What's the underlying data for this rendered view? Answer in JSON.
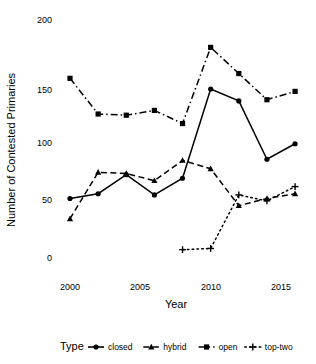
{
  "chart_data": {
    "type": "line",
    "title": "",
    "xlabel": "Year",
    "ylabel": "Number of Contested Primaries",
    "xlim": [
      1999,
      2017
    ],
    "ylim": [
      0,
      200
    ],
    "xticks": [
      2000,
      2005,
      2010,
      2015
    ],
    "xtick_labels": [
      "2000",
      "2005",
      "2010",
      "2015"
    ],
    "yticks": [
      0,
      50,
      100,
      150,
      200
    ],
    "ytick_labels": [
      "0",
      "50",
      "100",
      "150",
      "200"
    ],
    "grid": false,
    "legend_position": "bottom",
    "legend_title": "Type",
    "series": [
      {
        "name": "closed",
        "marker": "circle",
        "dash": "solid",
        "x": [
          2000,
          2002,
          2004,
          2006,
          2008,
          2010,
          2012,
          2014,
          2016
        ],
        "values": [
          50,
          54,
          70,
          53,
          67,
          142,
          132,
          83,
          96
        ]
      },
      {
        "name": "hybrid",
        "marker": "triangle",
        "dash": "dashed",
        "x": [
          2000,
          2002,
          2004,
          2006,
          2008,
          2010,
          2012,
          2014,
          2016
        ],
        "values": [
          33,
          72,
          71,
          65,
          82,
          75,
          44,
          50,
          54
        ]
      },
      {
        "name": "open",
        "marker": "square",
        "dash": "dashdot",
        "x": [
          2000,
          2002,
          2004,
          2006,
          2008,
          2010,
          2012,
          2014,
          2016
        ],
        "values": [
          151,
          121,
          120,
          124,
          113,
          177,
          155,
          133,
          140
        ]
      },
      {
        "name": "top-two",
        "marker": "plus",
        "dash": "dotted",
        "x": [
          2008,
          2010,
          2012,
          2014,
          2016
        ],
        "values": [
          7,
          8,
          53,
          48,
          60
        ]
      }
    ]
  },
  "legend": {
    "title": "Type",
    "entries": [
      {
        "label": "closed",
        "marker": "circle",
        "dash": "solid"
      },
      {
        "label": "hybrid",
        "marker": "triangle",
        "dash": "dashed"
      },
      {
        "label": "open",
        "marker": "square",
        "dash": "dashdot"
      },
      {
        "label": "top-two",
        "marker": "plus",
        "dash": "dotted"
      }
    ]
  },
  "colors": {
    "series": "#000000",
    "background": "#ffffff",
    "text": "#000000"
  }
}
